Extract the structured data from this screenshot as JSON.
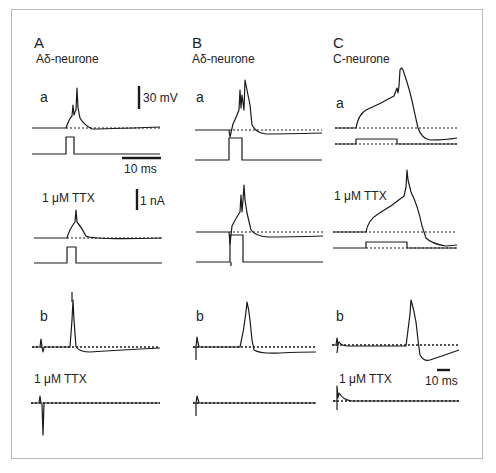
{
  "figure": {
    "panels": [
      {
        "letter": "A",
        "title": "Aδ-neurone"
      },
      {
        "letter": "B",
        "title": "Aδ-neurone"
      },
      {
        "letter": "C",
        "title": "C-neurone"
      }
    ],
    "row_labels": {
      "a": "a",
      "b": "b"
    },
    "ttx_label": "1 μM TTX",
    "scale_bars": {
      "voltage": "30 mV",
      "time_top": "10 ms",
      "current": "1 nA",
      "time_bottom": "10 ms"
    },
    "colors": {
      "trace": "#1a1a1a",
      "frame": "#b8b8b8",
      "background": "#ffffff"
    }
  }
}
